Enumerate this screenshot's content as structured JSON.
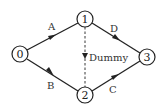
{
  "diagram": {
    "type": "activity-network",
    "nodes": [
      {
        "id": "0",
        "label": "0",
        "x": 20,
        "y": 54
      },
      {
        "id": "1",
        "label": "1",
        "x": 85,
        "y": 19
      },
      {
        "id": "2",
        "label": "2",
        "x": 85,
        "y": 95
      },
      {
        "id": "3",
        "label": "3",
        "x": 147,
        "y": 57
      }
    ],
    "edges": [
      {
        "from": "0",
        "to": "1",
        "label": "A",
        "style": "solid"
      },
      {
        "from": "0",
        "to": "2",
        "label": "B",
        "style": "solid"
      },
      {
        "from": "1",
        "to": "3",
        "label": "D",
        "style": "solid"
      },
      {
        "from": "2",
        "to": "3",
        "label": "C",
        "style": "solid"
      },
      {
        "from": "1",
        "to": "2",
        "label": "Dummy",
        "style": "dashed"
      }
    ],
    "colors": {
      "stroke": "#222222",
      "background": "#ffffff"
    }
  }
}
